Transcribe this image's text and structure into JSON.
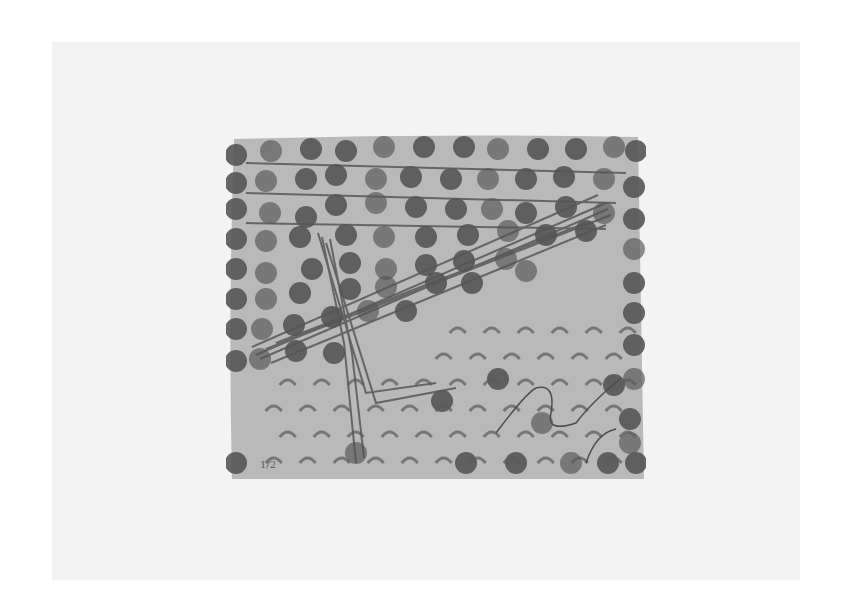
{
  "artwork": {
    "description": "Abstract print: gray rectangular field on white paper with rows of dark circular stamps, diagonal crayon-like strokes, crescent marks, and a thin wavy line",
    "inscription": "1/2",
    "colors": {
      "background": "#ffffff",
      "paper": "#f3f3f3",
      "field": "#b9b9b9",
      "dots": "#555555",
      "strokes": "#4a4a4a"
    },
    "dot_rows": [
      [
        [
          10,
          22
        ],
        [
          45,
          18
        ],
        [
          85,
          16
        ],
        [
          120,
          18
        ],
        [
          158,
          14
        ],
        [
          198,
          14
        ],
        [
          238,
          14
        ],
        [
          272,
          16
        ],
        [
          312,
          16
        ],
        [
          350,
          16
        ],
        [
          388,
          14
        ],
        [
          410,
          18
        ]
      ],
      [
        [
          10,
          50
        ],
        [
          40,
          48
        ],
        [
          80,
          46
        ],
        [
          110,
          42
        ],
        [
          150,
          46
        ],
        [
          185,
          44
        ],
        [
          225,
          46
        ],
        [
          262,
          46
        ],
        [
          300,
          46
        ],
        [
          338,
          44
        ],
        [
          378,
          46
        ],
        [
          408,
          54
        ]
      ],
      [
        [
          10,
          76
        ],
        [
          44,
          80
        ],
        [
          80,
          84
        ],
        [
          110,
          72
        ],
        [
          150,
          70
        ],
        [
          190,
          74
        ],
        [
          230,
          76
        ],
        [
          266,
          76
        ],
        [
          300,
          80
        ],
        [
          340,
          74
        ],
        [
          378,
          80
        ],
        [
          408,
          86
        ]
      ],
      [
        [
          10,
          106
        ],
        [
          40,
          108
        ],
        [
          74,
          104
        ],
        [
          120,
          102
        ],
        [
          158,
          104
        ],
        [
          200,
          104
        ],
        [
          242,
          102
        ],
        [
          282,
          98
        ],
        [
          320,
          102
        ],
        [
          360,
          98
        ],
        [
          408,
          116
        ]
      ],
      [
        [
          10,
          136
        ],
        [
          40,
          140
        ],
        [
          86,
          136
        ],
        [
          124,
          130
        ],
        [
          160,
          136
        ],
        [
          200,
          132
        ],
        [
          238,
          128
        ],
        [
          280,
          126
        ],
        [
          408,
          150
        ]
      ],
      [
        [
          10,
          166
        ],
        [
          40,
          166
        ],
        [
          74,
          160
        ],
        [
          124,
          156
        ],
        [
          160,
          154
        ],
        [
          210,
          150
        ],
        [
          246,
          150
        ],
        [
          300,
          138
        ],
        [
          408,
          180
        ]
      ],
      [
        [
          10,
          196
        ],
        [
          36,
          196
        ],
        [
          68,
          192
        ],
        [
          106,
          184
        ],
        [
          142,
          178
        ],
        [
          180,
          178
        ],
        [
          408,
          212
        ]
      ],
      [
        [
          10,
          228
        ],
        [
          34,
          226
        ],
        [
          70,
          218
        ],
        [
          108,
          220
        ],
        [
          408,
          246
        ]
      ]
    ],
    "bottom_dots": [
      [
        [
          10,
          330
        ],
        [
          130,
          320
        ],
        [
          216,
          268
        ],
        [
          272,
          246
        ],
        [
          316,
          290
        ],
        [
          388,
          252
        ],
        [
          404,
          286
        ],
        [
          404,
          310
        ],
        [
          382,
          330
        ],
        [
          410,
          330
        ],
        [
          345,
          330
        ],
        [
          290,
          330
        ],
        [
          240,
          330
        ]
      ]
    ]
  }
}
